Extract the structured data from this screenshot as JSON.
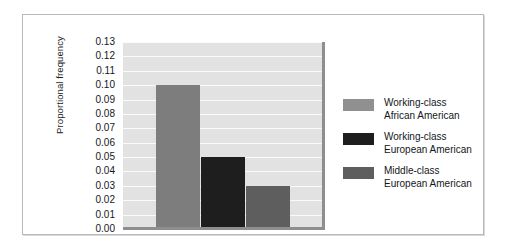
{
  "chart_data": {
    "type": "bar",
    "title": "",
    "xlabel": "",
    "ylabel": "Proportional frequency",
    "ylim": [
      0.0,
      0.13
    ],
    "ytick_step": 0.01,
    "ytick_labels": [
      "0.13",
      "0.12",
      "0.11",
      "0.10",
      "0.09",
      "0.08",
      "0.07",
      "0.06",
      "0.05",
      "0.04",
      "0.03",
      "0.02",
      "0.01",
      "0.00"
    ],
    "grid": true,
    "grid_color": "#fbfbfb",
    "plot_background": "#e2e2e2",
    "legend_position": "right",
    "categories": [
      "Working-class African American",
      "Working-class European American",
      "Middle-class European American"
    ],
    "values": [
      0.1,
      0.05,
      0.03
    ],
    "bar_colors": [
      "#7d7d7d",
      "#1e1e1e",
      "#5e5e5e"
    ]
  },
  "legend": {
    "items": [
      {
        "line1": "Working-class",
        "line2": "African American",
        "color": "#909090"
      },
      {
        "line1": "Working-class",
        "line2": "European American",
        "color": "#1e1e1e"
      },
      {
        "line1": "Middle-class",
        "line2": "European American",
        "color": "#5e5e5e"
      }
    ]
  }
}
